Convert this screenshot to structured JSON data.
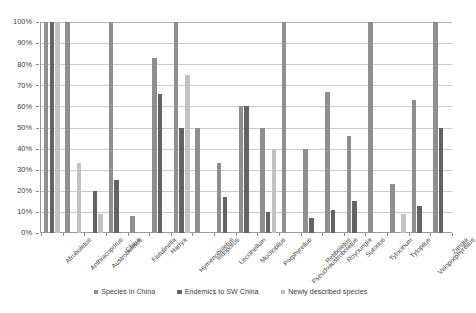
{
  "chart_data": {
    "type": "bar",
    "title": "",
    "subtitle": "",
    "xlabel": "",
    "ylabel": "",
    "ylim": [
      0,
      100
    ],
    "y_tick_labels": [
      "100%",
      "90%",
      "80%",
      "70%",
      "60%",
      "50%",
      "40%",
      "30%",
      "20%",
      "10%",
      "0%"
    ],
    "y_tick_values": [
      100,
      90,
      80,
      70,
      60,
      50,
      40,
      30,
      20,
      10,
      0
    ],
    "grid": true,
    "legend_position": "bottom",
    "value_unit": "percent",
    "categories": [
      "Afroboletus",
      "Anthracoporus",
      "Austroboletus",
      "Chiua",
      "Fistulinella",
      "Harrya",
      "Hymenoboletus",
      "Indoporus",
      "Leccinellum",
      "Mucilopilus",
      "Porphyrellus",
      "Pseudoaustroboletus",
      "Retiboletus",
      "Royoungia",
      "Sutorius",
      "Tylocinum",
      "Tylopilus",
      "Veloporphyrellus",
      "Zangia"
    ],
    "series": [
      {
        "name": "Species in China",
        "color": "#8f8f8f",
        "values": [
          100,
          100,
          0,
          100,
          8,
          83,
          100,
          50,
          33,
          60,
          50,
          100,
          40,
          67,
          46,
          100,
          23,
          63,
          100
        ]
      },
      {
        "name": "Endemics to SW China",
        "color": "#636363",
        "values": [
          100,
          0,
          20,
          25,
          0,
          66,
          50,
          0,
          17,
          60,
          10,
          0,
          7,
          11,
          15,
          0,
          0,
          13,
          50
        ]
      },
      {
        "name": "Newly described species",
        "color": "#c2c2c2",
        "values": [
          100,
          33,
          9,
          0,
          0,
          0,
          75,
          0,
          0,
          0,
          40,
          0,
          0,
          0,
          0,
          0,
          9,
          0,
          0
        ]
      }
    ]
  },
  "legend": {
    "items": [
      {
        "label": "Species in China",
        "swatch": "s0"
      },
      {
        "label": "Endemics to SW China",
        "swatch": "s1"
      },
      {
        "label": "Newly described species",
        "swatch": "s2"
      }
    ]
  }
}
